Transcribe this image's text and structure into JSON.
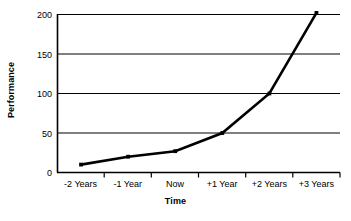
{
  "chart_data": {
    "type": "line",
    "title": "",
    "xlabel": "Time",
    "ylabel": "Performance",
    "categories": [
      "-2 Years",
      "-1 Year",
      "Now",
      "+1 Year",
      "+2 Years",
      "+3 Years"
    ],
    "values": [
      10,
      20,
      27,
      50,
      100,
      202
    ],
    "series": [
      {
        "name": "Performance",
        "values": [
          10,
          20,
          27,
          50,
          100,
          202
        ]
      }
    ],
    "ylim": [
      0,
      200
    ],
    "yticks": [
      0,
      50,
      100,
      150,
      200
    ],
    "ytick_labels": [
      "0",
      "50",
      "100",
      "150",
      "200"
    ],
    "grid": "horizontal",
    "legend": "none",
    "line_color": "#000000",
    "marker": "square",
    "marker_color": "#000000",
    "axis_color": "#000000",
    "grid_color": "#000000",
    "background_color": "#ffffff"
  },
  "axes": {
    "y_title": "Performance",
    "x_title": "Time"
  }
}
